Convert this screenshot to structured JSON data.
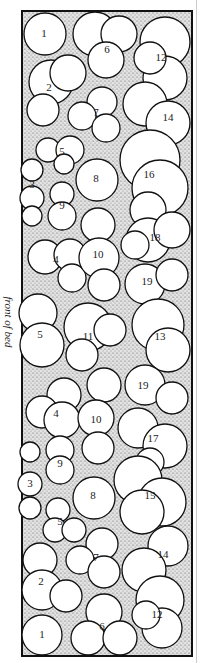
{
  "diagram": {
    "side_label": "front of bed",
    "colors": {
      "bed_fill": "#d9d9d9",
      "stipple": "#555555",
      "outline": "#111111",
      "plant_fill": "#ffffff"
    },
    "plants": [
      {
        "id": "p1a",
        "label": "1",
        "x": 44,
        "y": 34
      },
      {
        "id": "p6a",
        "label": "6",
        "x": 107,
        "y": 50
      },
      {
        "id": "p12a",
        "label": "12",
        "x": 161,
        "y": 58
      },
      {
        "id": "p2a",
        "label": "2",
        "x": 49,
        "y": 88
      },
      {
        "id": "p7a",
        "label": "7",
        "x": 96,
        "y": 113
      },
      {
        "id": "p14a",
        "label": "14",
        "x": 168,
        "y": 118
      },
      {
        "id": "p5a",
        "label": "5",
        "x": 62,
        "y": 152
      },
      {
        "id": "p3a",
        "label": "3",
        "x": 32,
        "y": 185
      },
      {
        "id": "p8a",
        "label": "8",
        "x": 96,
        "y": 179
      },
      {
        "id": "p16a",
        "label": "16",
        "x": 149,
        "y": 175
      },
      {
        "id": "p9a",
        "label": "9",
        "x": 62,
        "y": 206
      },
      {
        "id": "p18a",
        "label": "18",
        "x": 155,
        "y": 238
      },
      {
        "id": "p4a",
        "label": "4",
        "x": 56,
        "y": 260
      },
      {
        "id": "p10a",
        "label": "10",
        "x": 98,
        "y": 255
      },
      {
        "id": "p19a",
        "label": "19",
        "x": 147,
        "y": 282
      },
      {
        "id": "p5b",
        "label": "5",
        "x": 40,
        "y": 335
      },
      {
        "id": "p11a",
        "label": "11",
        "x": 88,
        "y": 337
      },
      {
        "id": "p13a",
        "label": "13",
        "x": 160,
        "y": 337
      },
      {
        "id": "p19b",
        "label": "19",
        "x": 143,
        "y": 386
      },
      {
        "id": "p4b",
        "label": "4",
        "x": 56,
        "y": 414
      },
      {
        "id": "p10b",
        "label": "10",
        "x": 96,
        "y": 420
      },
      {
        "id": "p17a",
        "label": "17",
        "x": 153,
        "y": 439
      },
      {
        "id": "p9b",
        "label": "9",
        "x": 60,
        "y": 464
      },
      {
        "id": "p3b",
        "label": "3",
        "x": 30,
        "y": 484
      },
      {
        "id": "p8b",
        "label": "8",
        "x": 93,
        "y": 496
      },
      {
        "id": "p15a",
        "label": "15",
        "x": 150,
        "y": 496
      },
      {
        "id": "p5c",
        "label": "5",
        "x": 60,
        "y": 522
      },
      {
        "id": "p7b",
        "label": "7",
        "x": 96,
        "y": 558
      },
      {
        "id": "p14b",
        "label": "14",
        "x": 163,
        "y": 555
      },
      {
        "id": "p2b",
        "label": "2",
        "x": 41,
        "y": 582
      },
      {
        "id": "p6b",
        "label": "6",
        "x": 102,
        "y": 627
      },
      {
        "id": "p12b",
        "label": "12",
        "x": 157,
        "y": 615
      },
      {
        "id": "p1b",
        "label": "1",
        "x": 42,
        "y": 635
      }
    ]
  }
}
